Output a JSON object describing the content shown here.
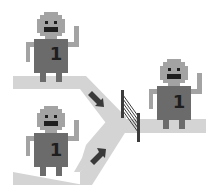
{
  "diagram": {
    "title": "",
    "colors": {
      "background": "#ffffff",
      "path": "#d4d4d4",
      "robot_head": "#a3a3a3",
      "robot_body": "#6b6b6b",
      "robot_features": "#1e1e1e",
      "arrow": "#3a3a3a",
      "gate": "#3c3c3c"
    },
    "robots": [
      {
        "id": "robot-top-left",
        "label": "1"
      },
      {
        "id": "robot-bottom-left",
        "label": "1"
      },
      {
        "id": "robot-right",
        "label": "1"
      }
    ],
    "arrows": [
      {
        "id": "arrow-top",
        "direction": "down-right"
      },
      {
        "id": "arrow-bottom",
        "direction": "up-right"
      }
    ],
    "gate": {
      "id": "gate",
      "type": "barrier"
    }
  }
}
